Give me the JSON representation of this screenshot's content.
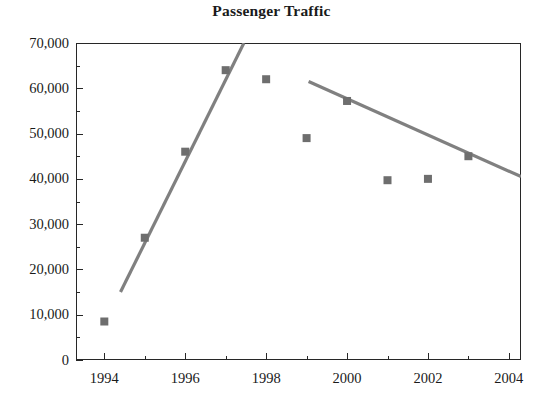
{
  "chart_data": {
    "type": "scatter",
    "title": "Passenger Traffic",
    "xlabel": "",
    "ylabel": "",
    "x": [
      1994,
      1995,
      1996,
      1997,
      1998,
      1999,
      2000,
      2001,
      2002,
      2003
    ],
    "values": [
      8500,
      27000,
      46000,
      64000,
      62000,
      49000,
      57200,
      39700,
      40000,
      45000
    ],
    "series": [
      {
        "name": "Passenger Traffic",
        "marker": "square",
        "color": "#6e6e6e",
        "x": [
          1994,
          1995,
          1996,
          1997,
          1998,
          1999,
          2000,
          2001,
          2002,
          2003
        ],
        "values": [
          8500,
          27000,
          46000,
          64000,
          62000,
          49000,
          57200,
          39700,
          40000,
          45000
        ]
      }
    ],
    "trendlines": [
      {
        "name": "rising-trend",
        "color": "#808080",
        "x0": 1994.4,
        "y0": 15000,
        "x1": 1997.45,
        "y1": 70000
      },
      {
        "name": "falling-trend",
        "color": "#808080",
        "x0": 1999.05,
        "y0": 61500,
        "x1": 2004.3,
        "y1": 40500
      }
    ],
    "xlim": [
      1993.3,
      2004.3
    ],
    "ylim": [
      0,
      70000
    ],
    "grid": false,
    "legend": false,
    "legend_position": "none",
    "y_ticks": [
      0,
      10000,
      20000,
      30000,
      40000,
      50000,
      60000,
      70000
    ],
    "y_tick_labels": [
      "0",
      "10,000",
      "20,000",
      "30,000",
      "40,000",
      "50,000",
      "60,000",
      "70,000"
    ],
    "y_minor_ticks": [
      5000,
      15000,
      25000,
      35000,
      45000,
      55000,
      65000
    ],
    "x_ticks": [
      1994,
      1996,
      1998,
      2000,
      2002,
      2004
    ],
    "x_tick_labels": [
      "1994",
      "1996",
      "1998",
      "2000",
      "2002",
      "2004"
    ],
    "x_minor_ticks": [
      1995,
      1997,
      1999,
      2001,
      2003
    ]
  },
  "colors": {
    "marker": "#6e6e6e",
    "trendline": "#808080",
    "axis": "#272727",
    "text": "#1a1a1a",
    "background": "#ffffff"
  }
}
